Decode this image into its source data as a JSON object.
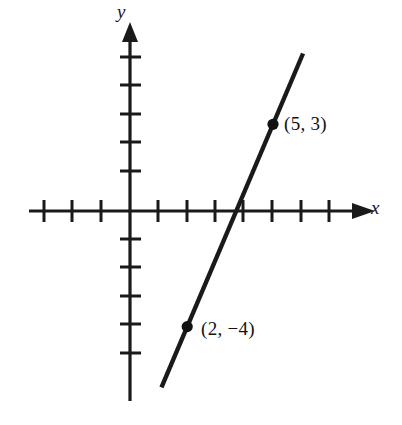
{
  "figure": {
    "title": "",
    "background_color": "#ffffff",
    "ink_color": "#1a1a1a"
  },
  "axes": {
    "x_label": "x",
    "y_label": "y",
    "x_axis_name": "horizontal-axis",
    "y_axis_name": "vertical-axis",
    "arrowheads": [
      "x-positive",
      "y-positive"
    ]
  },
  "labels": {
    "point_1": "(5, 3)",
    "point_2": "(2, −4)"
  },
  "chart_data": {
    "type": "line",
    "title": "",
    "xlabel": "x",
    "ylabel": "y",
    "grid": false,
    "legend": null,
    "xlim": [
      -3.6,
      8
    ],
    "ylim": [
      -6.6,
      6.3
    ],
    "x_ticks": [
      -3,
      -2,
      -1,
      1,
      2,
      3,
      4,
      5,
      6,
      7
    ],
    "y_ticks": [
      -5,
      -4,
      -3,
      -2,
      -1,
      1,
      2,
      3,
      4,
      5
    ],
    "tick_labels_shown": false,
    "series": [
      {
        "name": "line-through-points",
        "type": "line",
        "slope": 2.3333,
        "intercept": -8.6667,
        "equation": "y = (7/3)x - 26/3",
        "x": [
          1.1,
          6.05
        ],
        "y": [
          -6.1,
          5.45
        ],
        "color": "#1a1a1a",
        "linewidth": 4
      },
      {
        "name": "marked-points",
        "type": "scatter",
        "points": [
          {
            "x": 5,
            "y": 3,
            "label": "(5, 3)"
          },
          {
            "x": 2,
            "y": -4,
            "label": "(2, −4)"
          }
        ],
        "color": "#111111",
        "marker": "filled-circle",
        "marker_size": 9
      }
    ]
  }
}
